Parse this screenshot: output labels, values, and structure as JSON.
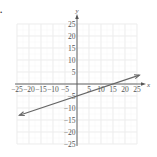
{
  "figure": {
    "label": "."
  },
  "chart_data": {
    "type": "line",
    "title": "",
    "xlabel": "x",
    "ylabel": "y",
    "xlim": [
      -25,
      25
    ],
    "ylim": [
      -25,
      25
    ],
    "grid": true,
    "x_ticks": [
      -25,
      -20,
      -15,
      -10,
      -5,
      5,
      10,
      15,
      20,
      25
    ],
    "y_ticks": [
      25,
      20,
      15,
      10,
      5,
      -5,
      -10,
      -15,
      -20,
      -25
    ],
    "x_tick_labels": [
      "−25",
      "−20",
      "−15",
      "−10",
      "−5",
      "5",
      "10",
      "15",
      "20",
      "25"
    ],
    "y_tick_labels": [
      "25",
      "20",
      "15",
      "10",
      "5",
      "−5",
      "−10",
      "−15",
      "−20",
      "−25"
    ],
    "series": [
      {
        "name": "line",
        "equation": "y = x/3 - 5",
        "x": [
          -24,
          0,
          15,
          26
        ],
        "y": [
          -13,
          -5,
          0,
          3.7
        ],
        "arrows": "both",
        "color": "#666666"
      }
    ]
  }
}
